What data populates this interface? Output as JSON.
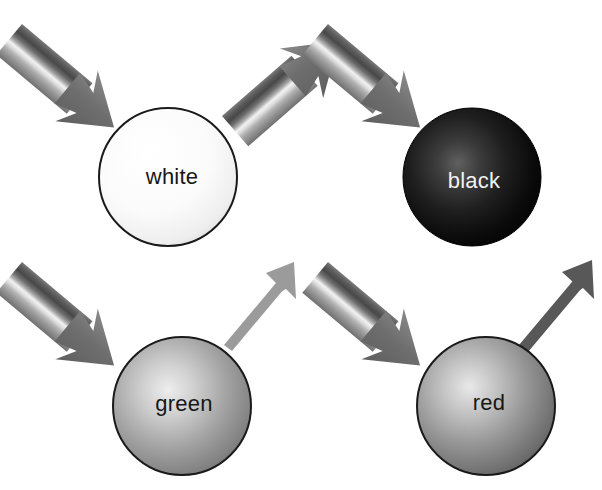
{
  "figure": {
    "width": 602,
    "height": 490,
    "background": "#ffffff"
  },
  "legend_semantics": {
    "incoming_arrow": "striped-broadband-light-beam",
    "outgoing_arrow": "reflected-light-beam",
    "thickness_meaning": "amount of reflected light",
    "darkness_meaning": "intensity of reflected light"
  },
  "panels": [
    {
      "id": "white",
      "label": "white",
      "label_color": "#171717",
      "position": "top-left",
      "sphere": {
        "cx": 168,
        "cy": 177,
        "r": 69,
        "fill_center": "#ffffff",
        "fill_edge": "#d8d8d8",
        "stroke": "#1a1a1a",
        "stroke_width": 2
      },
      "incoming_arrow": {
        "style": "striped",
        "thickness": "thick",
        "present": true
      },
      "outgoing_arrow": {
        "style": "striped",
        "thickness": "thick",
        "color": "#808080",
        "present": true
      }
    },
    {
      "id": "black",
      "label": "black",
      "label_color": "#f2f2f2",
      "position": "top-right",
      "sphere": {
        "cx": 472,
        "cy": 177,
        "r": 69,
        "fill_center": "#5a5a5a",
        "fill_edge": "#000000",
        "stroke": "#000000",
        "stroke_width": 1
      },
      "incoming_arrow": {
        "style": "striped",
        "thickness": "thick",
        "present": true
      },
      "outgoing_arrow": {
        "style": "none",
        "thickness": "none",
        "color": "none",
        "present": false
      }
    },
    {
      "id": "green",
      "label": "green",
      "label_color": "#171717",
      "position": "bottom-left",
      "sphere": {
        "cx": 182,
        "cy": 406,
        "r": 69,
        "fill_center": "#e6e6e6",
        "fill_edge": "#6e6e6e",
        "stroke": "#1a1a1a",
        "stroke_width": 2
      },
      "incoming_arrow": {
        "style": "striped",
        "thickness": "thick",
        "present": true
      },
      "outgoing_arrow": {
        "style": "solid",
        "thickness": "thin",
        "color": "#9b9b9b",
        "present": true
      }
    },
    {
      "id": "red",
      "label": "red",
      "label_color": "#171717",
      "position": "bottom-right",
      "sphere": {
        "cx": 486,
        "cy": 406,
        "r": 69,
        "fill_center": "#e0e0e0",
        "fill_edge": "#5c5c5c",
        "stroke": "#1a1a1a",
        "stroke_width": 2
      },
      "incoming_arrow": {
        "style": "striped",
        "thickness": "thick",
        "present": true
      },
      "outgoing_arrow": {
        "style": "solid",
        "thickness": "thin",
        "color": "#585858",
        "present": true
      }
    }
  ],
  "stripe_colors": {
    "band_1": "#6b6b6b",
    "band_2": "#4f4f4f",
    "band_3": "#8e8e8e",
    "band_4": "#f0f0f0",
    "band_5": "#c9c9c9",
    "band_6": "#9a9a9a",
    "band_7": "#7a7a7a",
    "arrowhead": "#747474"
  }
}
